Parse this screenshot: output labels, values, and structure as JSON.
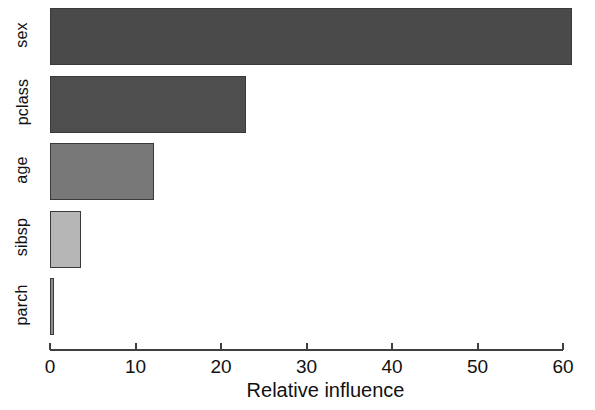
{
  "chart_data": {
    "type": "bar",
    "orientation": "horizontal",
    "title": "",
    "subtitle": "",
    "xlabel": "Relative influence",
    "ylabel": "",
    "categories": [
      "sex",
      "pclass",
      "age",
      "sibsp",
      "parch"
    ],
    "values": [
      61.1,
      22.9,
      12.2,
      3.6,
      0.5
    ],
    "series": [
      {
        "name": "Relative influence",
        "values": [
          61.1,
          22.9,
          12.2,
          3.6,
          0.5
        ]
      }
    ],
    "bar_colors": [
      "#4a4a4a",
      "#4e4e4e",
      "#787878",
      "#b6b6b6",
      "#8d8d8d"
    ],
    "bar_border_color": "#3a3a3a",
    "xlim": [
      0,
      61.5
    ],
    "xticks": [
      0,
      10,
      20,
      30,
      40,
      50,
      60
    ],
    "xticklabels": [
      "0",
      "10",
      "20",
      "30",
      "40",
      "50",
      "60"
    ],
    "grid": false,
    "legend": null,
    "annotations": [],
    "background": "#ffffff",
    "axis_color": "#3f3f3f",
    "text_color": "#111111"
  },
  "axis": {
    "x_title": "Relative influence",
    "ticks": [
      {
        "label": "0",
        "value": 0
      },
      {
        "label": "10",
        "value": 10
      },
      {
        "label": "20",
        "value": 20
      },
      {
        "label": "30",
        "value": 30
      },
      {
        "label": "40",
        "value": 40
      },
      {
        "label": "50",
        "value": 50
      },
      {
        "label": "60",
        "value": 60
      }
    ]
  },
  "bars": [
    {
      "label": "sex",
      "value": 61.1,
      "color": "#4a4a4a"
    },
    {
      "label": "pclass",
      "value": 22.9,
      "color": "#4e4e4e"
    },
    {
      "label": "age",
      "value": 12.2,
      "color": "#787878"
    },
    {
      "label": "sibsp",
      "value": 3.6,
      "color": "#b6b6b6"
    },
    {
      "label": "parch",
      "value": 0.5,
      "color": "#8d8d8d"
    }
  ]
}
